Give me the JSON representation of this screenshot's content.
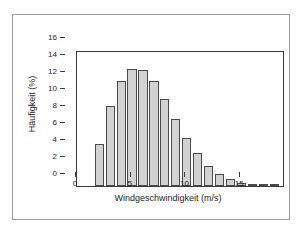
{
  "chart_data": {
    "type": "bar",
    "title": "",
    "xlabel": "Windgeschwindigkeit (m/s)",
    "ylabel": "Häufigkeit (%)",
    "xlim": [
      -1,
      18
    ],
    "ylim": [
      0,
      16
    ],
    "grid": false,
    "legend": null,
    "bar_width_ms": 1,
    "xticks": [
      0,
      5,
      10,
      15
    ],
    "xtick_labels": [
      "0",
      "5",
      "10",
      "15"
    ],
    "yticks": [
      0,
      2,
      4,
      6,
      8,
      10,
      12,
      14,
      16
    ],
    "ytick_labels": [
      "0",
      "2",
      "4",
      "6",
      "8",
      "10",
      "12",
      "14",
      "16"
    ],
    "categories": [
      "0",
      "1",
      "2",
      "3",
      "4",
      "5",
      "6",
      "7",
      "8",
      "9",
      "10",
      "11",
      "12",
      "13",
      "14",
      "15",
      "16",
      "17"
    ],
    "x": [
      0,
      1,
      2,
      3,
      4,
      5,
      6,
      7,
      8,
      9,
      10,
      11,
      12,
      13,
      14,
      15,
      16,
      17
    ],
    "values": [
      0,
      5.0,
      9.4,
      12.3,
      13.8,
      13.6,
      12.3,
      10.2,
      7.9,
      5.65,
      3.85,
      2.4,
      1.45,
      0.85,
      0.4,
      0.2,
      0.1,
      0.05
    ],
    "series": [
      {
        "name": "Häufigkeit",
        "values": [
          0,
          5.0,
          9.4,
          12.3,
          13.8,
          13.6,
          12.3,
          10.2,
          7.9,
          5.65,
          3.85,
          2.4,
          1.45,
          0.85,
          0.4,
          0.2,
          0.1,
          0.05
        ]
      }
    ],
    "colors": {
      "bar_fill": "#d2d2d2",
      "bar_edge": "#4a4a4a",
      "axis": "#3c3c3c",
      "text": "#1d1d1d",
      "frame": "#9a9a9a",
      "background": "#ffffff"
    }
  }
}
